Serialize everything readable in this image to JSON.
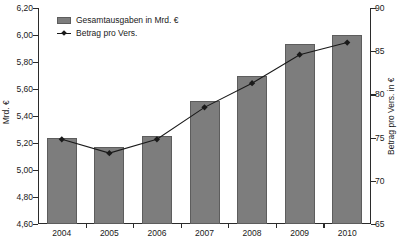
{
  "chart_data": {
    "type": "bar",
    "title": "",
    "subtitle": "",
    "xlabel": "",
    "ylabel": "Mrd. €",
    "y2label": "Betrag pro Vers. in €",
    "categories": [
      "2004",
      "2005",
      "2006",
      "2007",
      "2008",
      "2009",
      "2010"
    ],
    "series": [
      {
        "name": "Gesamtausgaben in Mrd. €",
        "type": "bar",
        "axis": "left",
        "color": "#7d7d7d",
        "values": [
          5.24,
          5.17,
          5.25,
          5.51,
          5.7,
          5.93,
          6.0
        ]
      },
      {
        "name": "Betrag pro Vers.",
        "type": "line",
        "axis": "right",
        "color": "#1a1a1a",
        "marker": "diamond",
        "values": [
          74.8,
          73.2,
          74.8,
          78.5,
          81.3,
          84.6,
          86.0
        ]
      }
    ],
    "ylim": [
      4.6,
      6.2
    ],
    "ytick_step": 0.2,
    "yticks": [
      "4,60",
      "4,80",
      "5,00",
      "5,20",
      "5,40",
      "5,60",
      "5,80",
      "6,00",
      "6,20"
    ],
    "ytick_values": [
      4.6,
      4.8,
      5.0,
      5.2,
      5.4,
      5.6,
      5.8,
      6.0,
      6.2
    ],
    "y2lim": [
      65,
      90
    ],
    "y2tick_step": 5,
    "y2ticks": [
      "65",
      "70",
      "75",
      "80",
      "85",
      "90"
    ],
    "y2tick_values": [
      65,
      70,
      75,
      80,
      85,
      90
    ],
    "grid": false,
    "legend_position": "top-left",
    "legend": [
      {
        "label": "Gesamtausgaben in Mrd. €",
        "marker": "bar-swatch"
      },
      {
        "label": "Betrag pro Vers.",
        "marker": "line-diamond"
      }
    ]
  },
  "colors": {
    "bar_fill": "#7d7d7d",
    "bar_edge": "#5d5d5d",
    "line": "#1a1a1a",
    "axis": "#2b2b2b",
    "text": "#1a1a1a",
    "background": "#ffffff"
  }
}
